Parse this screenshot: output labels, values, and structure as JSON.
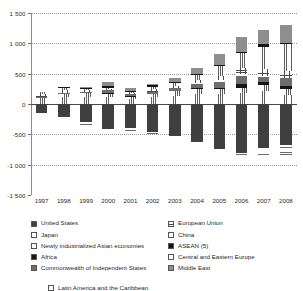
{
  "chart_data": {
    "type": "bar",
    "subtype": "stacked-diverging",
    "title": "",
    "subtitle": "",
    "xlabel": "",
    "ylabel": "",
    "categories": [
      "1997",
      "1998",
      "1999",
      "2000",
      "2001",
      "2002",
      "2003",
      "2004",
      "2005",
      "2006",
      "2007",
      "2008"
    ],
    "ylim": [
      -1500,
      1500
    ],
    "yticks": [
      1500,
      1000,
      500,
      0,
      -500,
      -1000,
      -1500
    ],
    "ytick_labels": [
      "1 500",
      "1 000",
      "500",
      "0",
      "-500",
      "-1 000",
      "-1 500"
    ],
    "grid": true,
    "legend_position": "bottom",
    "series": [
      {
        "name": "United States",
        "pattern": "p-solid-dark",
        "values": [
          -140,
          -215,
          -300,
          -415,
          -390,
          -455,
          -520,
          -630,
          -740,
          -800,
          -720,
          -675
        ]
      },
      {
        "name": "Japan",
        "pattern": "p-vstripe",
        "values": [
          95,
          115,
          110,
          120,
          85,
          110,
          135,
          170,
          165,
          175,
          210,
          155
        ]
      },
      {
        "name": "Newly industrialized Asian economies",
        "pattern": "p-grid-fine",
        "values": [
          10,
          60,
          65,
          50,
          45,
          60,
          85,
          80,
          80,
          95,
          110,
          90
        ]
      },
      {
        "name": "Africa",
        "pattern": "p-solid-black",
        "values": [
          0,
          0,
          0,
          10,
          5,
          0,
          0,
          10,
          25,
          65,
          45,
          55
        ]
      },
      {
        "name": "Commonwealth of Independent States",
        "pattern": "p-dark-gray",
        "values": [
          5,
          5,
          20,
          50,
          35,
          30,
          40,
          65,
          100,
          120,
          80,
          130
        ]
      },
      {
        "name": "Latin America and the Caribbean",
        "pattern": "p-hstripe-lt",
        "values": [
          -20,
          -30,
          -15,
          -20,
          -25,
          -10,
          0,
          15,
          25,
          40,
          15,
          -10
        ]
      },
      {
        "name": "European Union",
        "pattern": "p-grid",
        "values": [
          60,
          50,
          30,
          20,
          15,
          50,
          35,
          60,
          70,
          90,
          115,
          115
        ]
      },
      {
        "name": "China",
        "pattern": "p-vstripe",
        "values": [
          35,
          30,
          20,
          20,
          15,
          35,
          45,
          70,
          160,
          250,
          370,
          440
        ]
      },
      {
        "name": "ASEAN (5)",
        "pattern": "p-solid-black",
        "values": [
          -10,
          20,
          25,
          20,
          15,
          20,
          25,
          20,
          10,
          25,
          35,
          20
        ]
      },
      {
        "name": "Central and Eastern Europe",
        "pattern": "p-hstripe",
        "values": [
          -15,
          -20,
          -25,
          -30,
          -25,
          -30,
          -40,
          -55,
          -65,
          -100,
          -135,
          -155
        ]
      },
      {
        "name": "Middle East",
        "pattern": "p-mid-gray",
        "values": [
          0,
          0,
          15,
          75,
          40,
          30,
          60,
          105,
          190,
          250,
          245,
          290
        ]
      }
    ]
  },
  "axis": {
    "y_labels": [
      "1 500",
      "1 000",
      "500",
      "0",
      "-500",
      "-1 000",
      "-1 500"
    ],
    "x_labels": [
      "1997",
      "1998",
      "1999",
      "2000",
      "2001",
      "2002",
      "2003",
      "2004",
      "2005",
      "2006",
      "2007",
      "2008"
    ]
  },
  "legend": {
    "left_column": [
      {
        "label": "United States",
        "pattern": "p-solid-dark"
      },
      {
        "label": "Japan",
        "pattern": "p-vstripe"
      },
      {
        "label": "Newly industrialized Asian economies",
        "pattern": "p-grid-fine"
      },
      {
        "label": "Africa",
        "pattern": "p-solid-black"
      },
      {
        "label": "Commonwealth of Independent States",
        "pattern": "p-dark-gray"
      }
    ],
    "right_column": [
      {
        "label": "European Union",
        "pattern": "p-grid"
      },
      {
        "label": "China",
        "pattern": "p-vstripe"
      },
      {
        "label": "ASEAN (5)",
        "pattern": "p-solid-black"
      },
      {
        "label": "Central and Eastern Europe",
        "pattern": "p-hstripe"
      },
      {
        "label": "Middle East",
        "pattern": "p-mid-gray"
      }
    ],
    "bottom_item": {
      "label": "Latin America and the Caribbean",
      "pattern": "p-hstripe-lt"
    }
  }
}
